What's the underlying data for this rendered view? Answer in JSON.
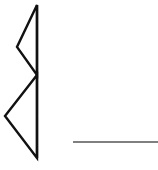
{
  "diagram": {
    "width": 158,
    "height": 170,
    "background": "#ffffff",
    "shapes": [
      {
        "id": "upper-triangle",
        "type": "polygon",
        "points": "37,5 17,47 37,75",
        "stroke": "#111111",
        "stroke_width": 2.4
      },
      {
        "id": "lower-triangle",
        "type": "polygon",
        "points": "37,75 5,116 37,158",
        "stroke": "#111111",
        "stroke_width": 2.4
      },
      {
        "id": "vertical-spine",
        "type": "line",
        "x1": 37,
        "y1": 5,
        "x2": 37,
        "y2": 158,
        "stroke": "#111111",
        "stroke_width": 2.4
      },
      {
        "id": "baseline",
        "type": "line",
        "x1": 73,
        "y1": 142,
        "x2": 158,
        "y2": 142,
        "stroke": "#555555",
        "stroke_width": 1.6
      }
    ]
  }
}
